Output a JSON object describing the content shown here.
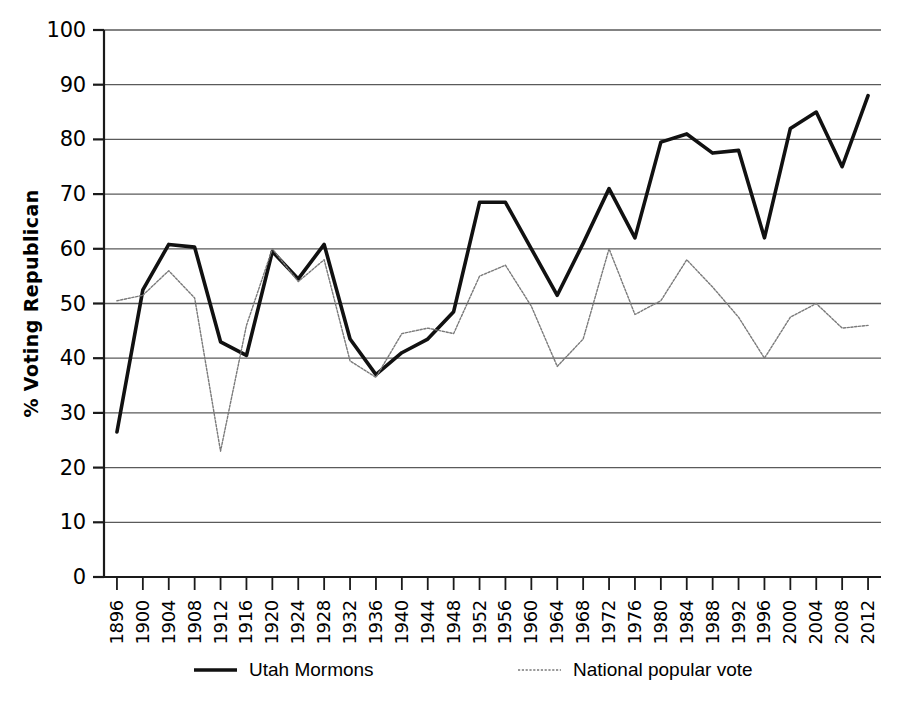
{
  "chart_data": {
    "type": "line",
    "title": "",
    "xlabel": "",
    "ylabel": "% Voting Republican",
    "ylim": [
      0,
      100
    ],
    "ytick_step": 10,
    "grid": true,
    "legend_position": "bottom",
    "yticks": [
      "0",
      "10",
      "20",
      "30",
      "40",
      "50",
      "60",
      "70",
      "80",
      "90",
      "100"
    ],
    "categories": [
      "1896",
      "1900",
      "1904",
      "1908",
      "1912",
      "1916",
      "1920",
      "1924",
      "1928",
      "1932",
      "1936",
      "1940",
      "1944",
      "1948",
      "1952",
      "1956",
      "1960",
      "1964",
      "1968",
      "1972",
      "1976",
      "1980",
      "1984",
      "1988",
      "1992",
      "1996",
      "2000",
      "2004",
      "2008",
      "2012"
    ],
    "series": [
      {
        "name": "Utah Mormons",
        "style": "solid",
        "color": "#111111",
        "width": 3.6,
        "values": [
          26.5,
          52.5,
          60.8,
          60.3,
          43.0,
          40.5,
          59.5,
          54.5,
          60.8,
          43.5,
          37.0,
          41.0,
          43.5,
          48.5,
          68.5,
          68.5,
          60.0,
          51.5,
          61.0,
          71.0,
          62.0,
          79.5,
          81.0,
          77.5,
          78.0,
          62.0,
          82.0,
          85.0,
          75.0,
          88.0
        ]
      },
      {
        "name": "National popular vote",
        "style": "dotted",
        "color": "#7a7a7a",
        "width": 1.4,
        "values": [
          50.5,
          51.5,
          56.0,
          51.0,
          23.0,
          46.0,
          60.0,
          54.0,
          58.0,
          39.5,
          36.5,
          44.5,
          45.5,
          44.5,
          55.0,
          57.0,
          49.5,
          38.5,
          43.5,
          60.0,
          48.0,
          50.5,
          58.0,
          53.0,
          47.5,
          40.0,
          47.5,
          50.0,
          45.5,
          46.0
        ]
      }
    ],
    "legend": [
      {
        "label": "Utah Mormons",
        "style": "solid"
      },
      {
        "label": "National popular vote",
        "style": "dotted"
      }
    ]
  }
}
